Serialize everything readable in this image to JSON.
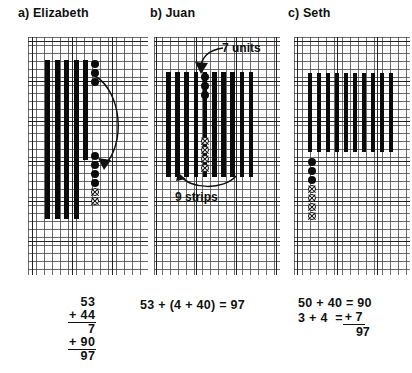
{
  "panels": [
    {
      "id": "a",
      "title": "a) Elizabeth",
      "strips_top": 4,
      "strips_bottom": 4,
      "units_filled": 5,
      "units_crossed": 2,
      "annotations": [],
      "equation_type": "vertical-stack",
      "equation_lines": [
        "53",
        "+ 44",
        "7",
        "+ 90",
        "97"
      ]
    },
    {
      "id": "b",
      "title": "b) Juan",
      "strips_total": 9,
      "units_filled": 3,
      "units_crossed": 4,
      "annotations": [
        {
          "name": "units-callout",
          "text": "7 units"
        },
        {
          "name": "strips-callout",
          "text": "9 strips"
        }
      ],
      "equation_type": "inline",
      "equation_lines": [
        "53 + (4 + 40) = 97"
      ]
    },
    {
      "id": "c",
      "title": "c) Seth",
      "strips_total": 9,
      "units_filled": 3,
      "units_crossed": 4,
      "annotations": [],
      "equation_type": "two-line",
      "equation_lines": [
        "50 + 40 = 90",
        "3 + 4  =",
        "+ 7",
        "97"
      ]
    }
  ],
  "colors": {
    "ink": "#0b0b0b",
    "grid_fine": "#3c3c3c",
    "grid_major": "#191919",
    "paper": "#ffffff"
  }
}
